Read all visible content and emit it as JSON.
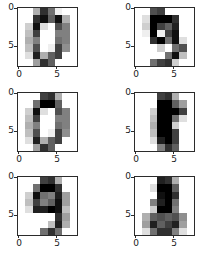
{
  "figure": {
    "background": "#ffffff",
    "layout": {
      "rows": 3,
      "cols": 2,
      "panel_count": 6
    },
    "axis_color": "#2b2b2b",
    "tick_label_color": "#1a1a1a"
  },
  "axis": {
    "xticks": [
      "0",
      "5"
    ],
    "yticks": [
      "0",
      "5"
    ],
    "xtick_values": [
      0,
      5
    ],
    "ytick_values": [
      0,
      5
    ]
  },
  "chart_data": {
    "type": "heatmap",
    "title": "",
    "xlabel": "",
    "ylabel": "",
    "colormap": "gray_r",
    "vmin": 0,
    "vmax": 16,
    "grid": false,
    "legend": "none",
    "xlim": [
      -0.5,
      7.5
    ],
    "ylim": [
      7.5,
      -0.5
    ],
    "image_shape": [
      8,
      8
    ],
    "panels": [
      {
        "index": 0,
        "position": "top-left",
        "digit_label": "4",
        "xticklabels": [
          "0",
          "5"
        ],
        "yticklabels": [
          "0",
          "5"
        ],
        "values": [
          [
            0,
            0,
            5,
            13,
            9,
            1,
            0,
            0
          ],
          [
            0,
            0,
            13,
            15,
            10,
            15,
            5,
            0
          ],
          [
            0,
            3,
            15,
            2,
            0,
            11,
            8,
            0
          ],
          [
            0,
            4,
            12,
            0,
            0,
            8,
            8,
            0
          ],
          [
            0,
            5,
            8,
            0,
            0,
            9,
            8,
            0
          ],
          [
            0,
            4,
            11,
            0,
            1,
            12,
            7,
            0
          ],
          [
            0,
            2,
            14,
            5,
            10,
            12,
            0,
            0
          ],
          [
            0,
            0,
            6,
            13,
            10,
            0,
            0,
            0
          ]
        ]
      },
      {
        "index": 1,
        "position": "top-right",
        "digit_label": "9",
        "xticklabels": [
          "0",
          "5"
        ],
        "yticklabels": [
          "0",
          "5"
        ],
        "values": [
          [
            0,
            0,
            11,
            12,
            0,
            0,
            0,
            0
          ],
          [
            0,
            2,
            16,
            16,
            16,
            13,
            0,
            0
          ],
          [
            0,
            3,
            16,
            12,
            10,
            14,
            0,
            0
          ],
          [
            0,
            1,
            16,
            1,
            12,
            15,
            0,
            0
          ],
          [
            0,
            0,
            13,
            16,
            9,
            15,
            2,
            0
          ],
          [
            0,
            0,
            0,
            3,
            0,
            9,
            11,
            0
          ],
          [
            0,
            0,
            0,
            0,
            9,
            15,
            4,
            0
          ],
          [
            0,
            0,
            9,
            12,
            13,
            3,
            0,
            0
          ]
        ]
      },
      {
        "index": 2,
        "position": "middle-left",
        "digit_label": "0",
        "xticklabels": [
          "0",
          "5"
        ],
        "yticklabels": [
          "0",
          "5"
        ],
        "values": [
          [
            0,
            0,
            0,
            12,
            13,
            5,
            0,
            0
          ],
          [
            0,
            0,
            9,
            16,
            16,
            10,
            0,
            0
          ],
          [
            0,
            3,
            15,
            2,
            0,
            11,
            8,
            0
          ],
          [
            0,
            4,
            12,
            0,
            0,
            8,
            8,
            0
          ],
          [
            0,
            5,
            8,
            0,
            0,
            9,
            8,
            0
          ],
          [
            0,
            4,
            11,
            0,
            1,
            12,
            7,
            0
          ],
          [
            0,
            2,
            14,
            5,
            10,
            12,
            0,
            0
          ],
          [
            0,
            0,
            6,
            13,
            10,
            0,
            0,
            0
          ]
        ]
      },
      {
        "index": 3,
        "position": "middle-right",
        "digit_label": "1",
        "xticklabels": [
          "0",
          "5"
        ],
        "yticklabels": [
          "0",
          "5"
        ],
        "values": [
          [
            0,
            0,
            0,
            12,
            13,
            5,
            0,
            0
          ],
          [
            0,
            0,
            0,
            16,
            16,
            10,
            6,
            0
          ],
          [
            0,
            0,
            3,
            16,
            16,
            16,
            12,
            0
          ],
          [
            0,
            0,
            4,
            16,
            16,
            9,
            2,
            0
          ],
          [
            0,
            0,
            5,
            16,
            16,
            3,
            0,
            0
          ],
          [
            0,
            0,
            4,
            16,
            16,
            12,
            0,
            0
          ],
          [
            0,
            0,
            2,
            14,
            16,
            12,
            0,
            0
          ],
          [
            0,
            0,
            0,
            8,
            13,
            10,
            0,
            0
          ]
        ]
      },
      {
        "index": 4,
        "position": "bottom-left",
        "digit_label": "9",
        "xticklabels": [
          "0",
          "5"
        ],
        "yticklabels": [
          "0",
          "5"
        ],
        "values": [
          [
            0,
            0,
            0,
            12,
            13,
            5,
            0,
            0
          ],
          [
            0,
            0,
            9,
            16,
            16,
            13,
            0,
            0
          ],
          [
            0,
            3,
            15,
            9,
            8,
            14,
            6,
            0
          ],
          [
            0,
            4,
            12,
            8,
            10,
            15,
            6,
            0
          ],
          [
            0,
            2,
            14,
            14,
            16,
            15,
            4,
            0
          ],
          [
            0,
            0,
            0,
            0,
            0,
            13,
            6,
            0
          ],
          [
            0,
            0,
            0,
            0,
            4,
            14,
            5,
            0
          ],
          [
            0,
            0,
            0,
            9,
            13,
            9,
            0,
            0
          ]
        ]
      },
      {
        "index": 5,
        "position": "bottom-right",
        "digit_label": "8",
        "xticklabels": [
          "0",
          "5"
        ],
        "yticklabels": [
          "0",
          "5"
        ],
        "values": [
          [
            0,
            0,
            0,
            14,
            13,
            5,
            0,
            0
          ],
          [
            0,
            0,
            2,
            16,
            16,
            10,
            0,
            0
          ],
          [
            0,
            0,
            0,
            15,
            16,
            13,
            0,
            0
          ],
          [
            0,
            0,
            8,
            14,
            16,
            9,
            0,
            0
          ],
          [
            0,
            0,
            3,
            16,
            16,
            8,
            0,
            0
          ],
          [
            0,
            5,
            10,
            11,
            10,
            11,
            7,
            0
          ],
          [
            0,
            6,
            14,
            10,
            12,
            14,
            6,
            0
          ],
          [
            0,
            2,
            9,
            13,
            13,
            8,
            2,
            0
          ]
        ]
      }
    ]
  }
}
